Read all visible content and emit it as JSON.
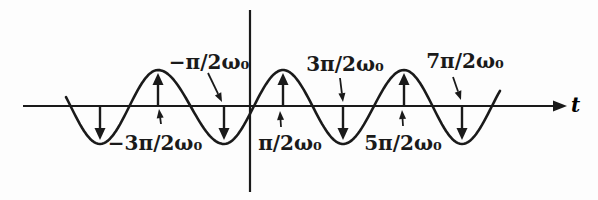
{
  "figure": {
    "background_color": "#fdfdfd",
    "ink_color": "#1a1a1a",
    "axis": {
      "t_label": "t"
    },
    "wave": {
      "axis_y": 106,
      "crest_y": 70,
      "trough_y": 144,
      "x_start": 66,
      "x_end": 500,
      "extrema": [
        {
          "x": 42,
          "type": "crest",
          "virtual": true
        },
        {
          "x": 100,
          "type": "trough",
          "virtual": false
        },
        {
          "x": 158,
          "type": "crest",
          "virtual": false
        },
        {
          "x": 224,
          "type": "trough",
          "virtual": false
        },
        {
          "x": 283,
          "type": "crest",
          "virtual": false
        },
        {
          "x": 343,
          "type": "trough",
          "virtual": false
        },
        {
          "x": 404,
          "type": "crest",
          "virtual": false
        },
        {
          "x": 462,
          "type": "trough",
          "virtual": false
        },
        {
          "x": 521,
          "type": "crest",
          "virtual": true
        }
      ]
    },
    "impulses": [
      {
        "x": 100,
        "dir": "down"
      },
      {
        "x": 158,
        "dir": "up"
      },
      {
        "x": 224,
        "dir": "down"
      },
      {
        "x": 283,
        "dir": "up"
      },
      {
        "x": 343,
        "dir": "down"
      },
      {
        "x": 404,
        "dir": "up"
      },
      {
        "x": 462,
        "dir": "down"
      }
    ],
    "annotations": [
      {
        "text": "−π/2ω₀",
        "tx": 209,
        "ty": 69,
        "leader": {
          "x1": 208,
          "y1": 73,
          "x2": 222,
          "y2": 102
        }
      },
      {
        "text": "−3π/2ω₀",
        "tx": 155,
        "ty": 150,
        "leader": {
          "x1": 161,
          "y1": 124,
          "x2": 159,
          "y2": 109
        }
      },
      {
        "text": "π/2ω₀",
        "tx": 290,
        "ty": 150,
        "leader": {
          "x1": 281,
          "y1": 127,
          "x2": 280,
          "y2": 111
        }
      },
      {
        "text": "3π/2ω₀",
        "tx": 345,
        "ty": 71,
        "leader": {
          "x1": 340,
          "y1": 78,
          "x2": 343,
          "y2": 102
        }
      },
      {
        "text": "5π/2ω₀",
        "tx": 403,
        "ty": 150,
        "leader": {
          "x1": 403,
          "y1": 126,
          "x2": 402,
          "y2": 110
        }
      },
      {
        "text": "7π/2ω₀",
        "tx": 465,
        "ty": 68,
        "leader": {
          "x1": 453,
          "y1": 77,
          "x2": 461,
          "y2": 100
        }
      }
    ]
  },
  "chart_data": {
    "type": "line",
    "title": "",
    "xlabel": "t",
    "ylabel": "",
    "annotation_labels": [
      "−3π/2ω₀",
      "−π/2ω₀",
      "π/2ω₀",
      "3π/2ω₀",
      "5π/2ω₀",
      "7π/2ω₀"
    ]
  }
}
